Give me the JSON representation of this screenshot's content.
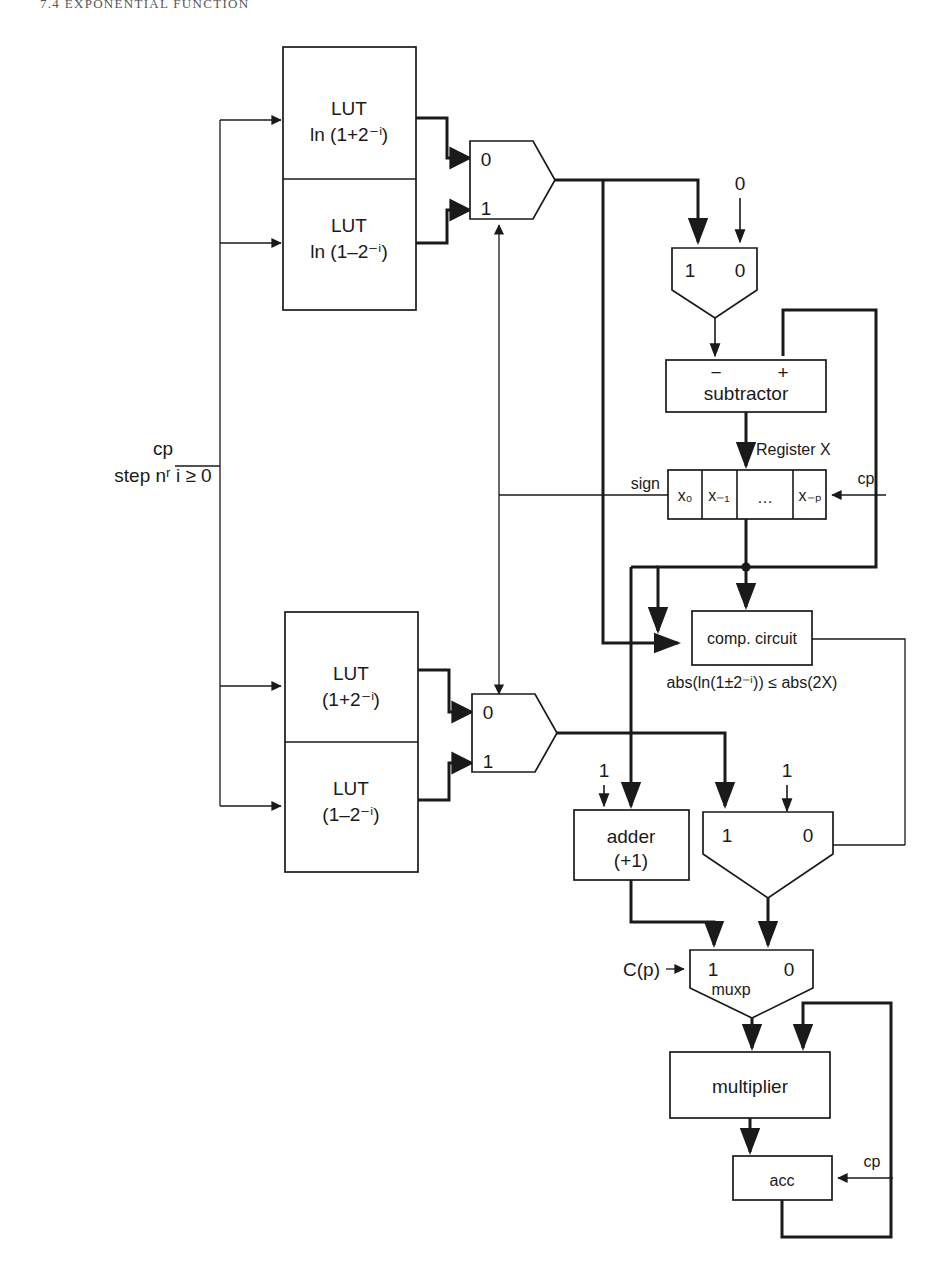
{
  "page": {
    "running_head": "7.4   EXPONENTIAL FUNCTION",
    "figure_kind": "digital circuit block diagram"
  },
  "inputs": {
    "clock_label": "cp",
    "step_label": "step nʳ i ≥ 0",
    "const_zero": "0",
    "const_one_a": "1",
    "const_one_b": "1",
    "cp_register": "cp",
    "cp_acc": "cp",
    "cp_sel": "C(p)"
  },
  "lut_top": {
    "upper_line1": "LUT",
    "upper_line2": "ln (1+2⁻ⁱ)",
    "lower_line1": "LUT",
    "lower_line2": "ln (1–2⁻ⁱ)"
  },
  "lut_bottom": {
    "upper_line1": "LUT",
    "upper_line2": "(1+2⁻ⁱ)",
    "lower_line1": "LUT",
    "lower_line2": "(1–2⁻ⁱ)"
  },
  "mux_lut_top": {
    "in0": "0",
    "in1": "1"
  },
  "mux_lut_bottom": {
    "in0": "0",
    "in1": "1"
  },
  "mux_sub": {
    "in1": "1",
    "in0": "0"
  },
  "mux_mult": {
    "in1": "1",
    "in0": "0"
  },
  "muxp": {
    "in1": "1",
    "in0": "0",
    "name": "muxp"
  },
  "subtractor": {
    "label": "subtractor",
    "minus_port": "−",
    "plus_port": "+"
  },
  "register": {
    "title": "Register X",
    "sign_label": "sign",
    "cells": [
      "x₀",
      "x₋₁",
      "…",
      "x₋ₚ"
    ]
  },
  "comparator": {
    "label": "comp. circuit",
    "condition": "abs(ln(1±2⁻ⁱ)) ≤ abs(2X)"
  },
  "adder": {
    "line1": "adder",
    "line2": "(+1)"
  },
  "multiplier": {
    "label": "multiplier"
  },
  "accumulator": {
    "label": "acc"
  },
  "colors": {
    "ink": "#1a1a1a",
    "paper": "#ffffff",
    "head": "#55565a"
  }
}
